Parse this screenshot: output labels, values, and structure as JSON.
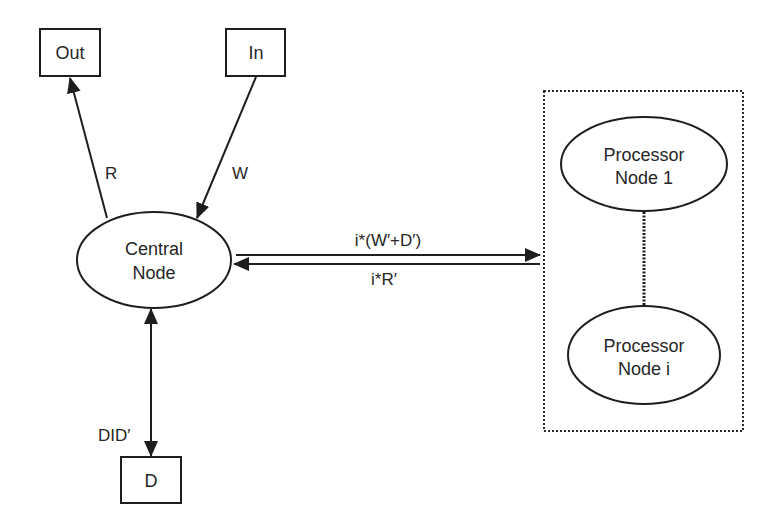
{
  "diagram": {
    "nodes": {
      "out": {
        "label": "Out"
      },
      "in": {
        "label": "In"
      },
      "central": {
        "line1": "Central",
        "line2": "Node"
      },
      "d": {
        "label": "D"
      },
      "processor1": {
        "line1": "Processor",
        "line2": "Node 1"
      },
      "processori": {
        "line1": "Processor",
        "line2": "Node i"
      }
    },
    "edges": {
      "central_to_out": {
        "label": "R"
      },
      "in_to_central": {
        "label": "W"
      },
      "central_d": {
        "label": "DID′"
      },
      "central_to_processors": {
        "label": "i*(W′+D′)"
      },
      "processors_to_central": {
        "label": "i*R′"
      }
    },
    "group": {
      "name": "processor-group",
      "style": "dotted"
    }
  }
}
